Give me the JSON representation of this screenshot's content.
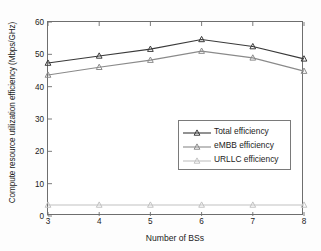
{
  "chart_data": {
    "type": "line",
    "title": "",
    "xlabel": "Number of BSs",
    "ylabel": "Compute resource utilization efficiency (Mbps/GHz)",
    "x": [
      3,
      4,
      5,
      6,
      7,
      8
    ],
    "xlim": [
      3,
      8
    ],
    "ylim": [
      0,
      60
    ],
    "xticks": [
      "3",
      "4",
      "5",
      "6",
      "7",
      "8"
    ],
    "yticks": [
      "0",
      "10",
      "20",
      "30",
      "40",
      "50",
      "60"
    ],
    "grid": false,
    "legend_position": "center-right",
    "marker": "triangle",
    "series": [
      {
        "name": "Total efficiency",
        "values": [
          47.3,
          49.5,
          51.6,
          54.6,
          52.4,
          48.6
        ],
        "color": "#3a3a3a"
      },
      {
        "name": "eMBB efficiency",
        "values": [
          43.6,
          46.0,
          48.2,
          51.0,
          48.9,
          44.8
        ],
        "color": "#8a8a8a"
      },
      {
        "name": "URLLC efficiency",
        "values": [
          3.4,
          3.4,
          3.4,
          3.4,
          3.4,
          3.4
        ],
        "color": "#c2c2c2"
      }
    ]
  }
}
